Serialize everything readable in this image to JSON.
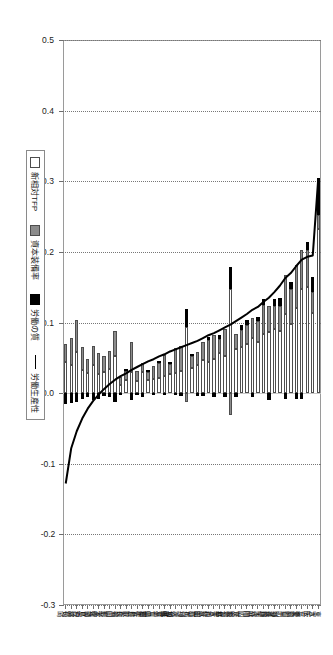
{
  "chart_data": {
    "type": "bar",
    "orientation": "horizontal-rotated",
    "stacked": true,
    "title": "",
    "xlabel": "",
    "ylabel": "",
    "ylim": [
      -0.3,
      0.5
    ],
    "yticks": [
      "0.5",
      "0.4",
      "0.3",
      "0.2",
      "0.1",
      "0.0",
      "-0.1",
      "-0.2",
      "-0.3"
    ],
    "grid": true,
    "legend_position": "bottom-right",
    "legend": [
      "新相対TFP",
      "資本装備率",
      "労働の質",
      "労働生産性"
    ],
    "colors": {
      "tfp": "#ffffff",
      "capital": "#8c8c8c",
      "quality": "#000000",
      "line": "#000000",
      "axis": "#9a9a9a",
      "grid": "#777777"
    },
    "categories": [
      "東京",
      "大阪",
      "千葉",
      "三重",
      "愛知",
      "滋賀",
      "山口",
      "北海道",
      "神奈川",
      "長野",
      "兵庫",
      "大分",
      "静岡",
      "岡山",
      "広島",
      "茨城",
      "鹿児島",
      "福井",
      "栃木",
      "青森",
      "和歌山",
      "秋田",
      "富山",
      "群馬",
      "石川",
      "神奈川県",
      "茨城県",
      "埼玉",
      "岐阜",
      "滋賀県",
      "十三重",
      "山梨",
      "岩手",
      "佐賀",
      "鳥取",
      "奈良",
      "新潟",
      "福岡",
      "山形",
      "熊本",
      "愛媛",
      "宮崎",
      "徳島",
      "島根",
      "沖縄",
      "高知",
      "長崎"
    ],
    "series": [
      {
        "name": "新相対TFP",
        "values": [
          0.232,
          0.113,
          0.15,
          0.147,
          0.12,
          0.098,
          0.112,
          0.088,
          0.091,
          0.086,
          0.084,
          0.072,
          0.078,
          0.07,
          0.066,
          0.062,
          0.148,
          0.052,
          0.057,
          0.049,
          0.044,
          0.047,
          0.04,
          0.035,
          0.094,
          0.031,
          0.029,
          0.027,
          0.024,
          0.022,
          0.02,
          0.018,
          0.03,
          0.017,
          0.03,
          0.019,
          0.012,
          0.052,
          0.034,
          0.03,
          0.027,
          0.04,
          0.029,
          0.033,
          0.058,
          0.04,
          0.044
        ]
      },
      {
        "name": "資本装備率",
        "values": [
          0.02,
          0.03,
          0.052,
          0.056,
          0.061,
          0.049,
          0.055,
          0.035,
          0.032,
          0.038,
          0.041,
          0.03,
          0.028,
          0.026,
          0.024,
          0.022,
          -0.031,
          0.039,
          0.02,
          0.034,
          0.031,
          0.026,
          0.018,
          0.017,
          -0.012,
          0.036,
          0.035,
          0.014,
          0.03,
          0.02,
          0.018,
          0.012,
          0.013,
          0.014,
          0.042,
          0.012,
          0.011,
          0.036,
          0.025,
          0.022,
          0.03,
          0.027,
          0.019,
          0.032,
          0.045,
          0.038,
          0.026
        ]
      },
      {
        "name": "労働の質",
        "values": [
          0.052,
          0.022,
          0.012,
          -0.008,
          -0.008,
          0.01,
          -0.009,
          0.012,
          0.01,
          -0.01,
          0.008,
          0.006,
          -0.006,
          0.008,
          0.006,
          -0.005,
          0.03,
          -0.006,
          0.005,
          -0.005,
          0.004,
          -0.004,
          -0.004,
          0.004,
          0.025,
          -0.004,
          -0.003,
          0.003,
          -0.003,
          0.003,
          -0.003,
          0.003,
          -0.006,
          -0.003,
          -0.01,
          0.003,
          -0.003,
          -0.012,
          -0.006,
          -0.004,
          -0.008,
          -0.01,
          -0.006,
          -0.009,
          -0.012,
          -0.014,
          -0.016
        ]
      }
    ],
    "line_series": {
      "name": "労働生産性",
      "values": [
        0.304,
        0.195,
        0.193,
        0.189,
        0.18,
        0.17,
        0.163,
        0.152,
        0.143,
        0.135,
        0.129,
        0.122,
        0.118,
        0.112,
        0.107,
        0.102,
        0.097,
        0.093,
        0.089,
        0.085,
        0.082,
        0.078,
        0.074,
        0.071,
        0.068,
        0.065,
        0.062,
        0.059,
        0.055,
        0.052,
        0.048,
        0.045,
        0.041,
        0.037,
        0.033,
        0.028,
        0.024,
        0.019,
        0.013,
        0.006,
        -0.002,
        -0.011,
        -0.022,
        -0.036,
        -0.054,
        -0.078,
        -0.128
      ]
    }
  },
  "legend": {
    "items": [
      {
        "label": "新相対TFP",
        "marker": "swatch-white"
      },
      {
        "label": "資本装備率",
        "marker": "swatch-grey"
      },
      {
        "label": "労働の質",
        "marker": "swatch-black"
      },
      {
        "label": "労働生産性",
        "marker": "line-black"
      }
    ]
  }
}
